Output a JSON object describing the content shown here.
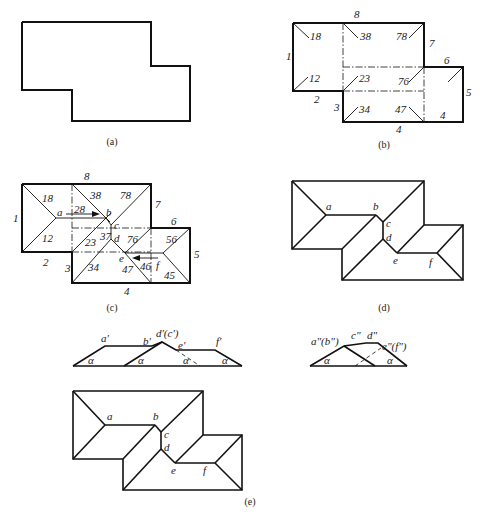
{
  "figures": {
    "a": {
      "caption": "(a)"
    },
    "b": {
      "caption": "(b)",
      "edge_labels": [
        "1",
        "2",
        "3",
        "4",
        "4",
        "5",
        "6",
        "7",
        "8"
      ],
      "plane_labels": [
        "18",
        "12",
        "38",
        "78",
        "23",
        "76",
        "34",
        "47"
      ]
    },
    "c": {
      "caption": "(c)",
      "edge_labels": [
        "1",
        "2",
        "3",
        "4",
        "5",
        "6",
        "7",
        "8"
      ],
      "plane_labels": [
        "18",
        "12",
        "28",
        "38",
        "78",
        "23",
        "37",
        "76",
        "34",
        "47",
        "46",
        "56",
        "45"
      ],
      "point_labels": [
        "a",
        "b",
        "c",
        "d",
        "e",
        "f"
      ]
    },
    "d": {
      "caption": "(d)",
      "point_labels": [
        "a",
        "b",
        "c",
        "d",
        "e",
        "f"
      ]
    },
    "e": {
      "caption": "(e)",
      "front_view_labels": [
        "a'",
        "b'",
        "d'(c')",
        "e'",
        "f'"
      ],
      "side_view_labels": [
        "a\"(b\")",
        "c\"",
        "d\"",
        "e\"(f\")"
      ],
      "angle_label": "α",
      "plan_point_labels": [
        "a",
        "b",
        "c",
        "d",
        "e",
        "f"
      ]
    }
  }
}
